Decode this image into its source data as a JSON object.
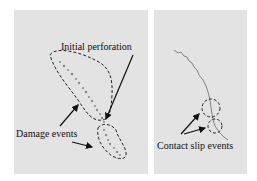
{
  "figure": {
    "panels": [
      {
        "id": "left",
        "background": "#e3e3e3",
        "labels": {
          "initial_perforation": "Initial perforation",
          "damage_events": "Damage events"
        }
      },
      {
        "id": "right",
        "background": "#e3e3e3",
        "labels": {
          "contact_slip_events": "Contact slip events"
        }
      }
    ],
    "colors": {
      "dash": "#222222",
      "arrow": "#111111",
      "trace": "#777777"
    }
  }
}
